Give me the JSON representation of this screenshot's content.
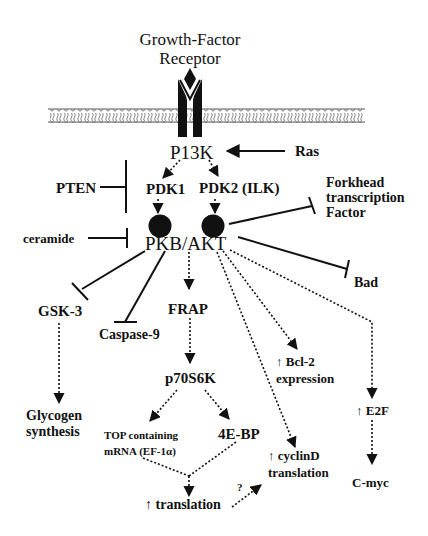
{
  "diagram": {
    "type": "signaling-pathway",
    "receptor": {
      "title_line1": "Growth-Factor",
      "title_line2": "Receptor"
    },
    "nodes": {
      "pi3k": "P13K",
      "ras": "Ras",
      "pten": "PTEN",
      "pdk1": "PDK1",
      "pdk2": "PDK2 (ILK)",
      "forkhead_line1": "Forkhead",
      "forkhead_line2": "transcription",
      "forkhead_line3": "Factor",
      "ceramide": "ceramide",
      "pkb_akt": "PKB/AKT",
      "bad": "Bad",
      "gsk3": "GSK-3",
      "caspase9": "Caspase-9",
      "frap": "FRAP",
      "bcl2_line1": "↑ Bcl-2",
      "bcl2_line2": "expression",
      "p70s6k": "p70S6K",
      "e2f": "↑ E2F",
      "glycogen_line1": "Glycogen",
      "glycogen_line2": "synthesis",
      "top_line1": "TOP containing",
      "top_line2": "mRNA (EF-1α)",
      "fourebp": "4E-BP",
      "cyclind_line1": "↑ cyclinD",
      "cyclind_line2": "translation",
      "cmyc": "C-myc",
      "translation": "↑ translation",
      "question": "?"
    },
    "edges": [
      {
        "from": "Ras",
        "to": "P13K",
        "type": "activation-solid"
      },
      {
        "from": "P13K",
        "to": "PDK1",
        "type": "activation-dotted"
      },
      {
        "from": "P13K",
        "to": "PDK2 (ILK)",
        "type": "activation-dotted"
      },
      {
        "from": "PTEN",
        "to": "P13K/PDK",
        "type": "inhibition"
      },
      {
        "from": "PDK1",
        "to": "PKB/AKT",
        "type": "activation-dotted"
      },
      {
        "from": "PDK2 (ILK)",
        "to": "PKB/AKT",
        "type": "activation-dotted"
      },
      {
        "from": "ceramide",
        "to": "PKB/AKT",
        "type": "inhibition"
      },
      {
        "from": "PKB/AKT",
        "to": "Forkhead transcription Factor",
        "type": "inhibition"
      },
      {
        "from": "PKB/AKT",
        "to": "Bad",
        "type": "inhibition"
      },
      {
        "from": "PKB/AKT",
        "to": "GSK-3",
        "type": "inhibition"
      },
      {
        "from": "PKB/AKT",
        "to": "Caspase-9",
        "type": "inhibition"
      },
      {
        "from": "PKB/AKT",
        "to": "FRAP",
        "type": "activation-dotted"
      },
      {
        "from": "PKB/AKT",
        "to": "Bcl-2 expression",
        "type": "activation-dotted"
      },
      {
        "from": "PKB/AKT",
        "to": "cyclinD translation",
        "type": "activation-dotted"
      },
      {
        "from": "PKB/AKT",
        "to": "E2F",
        "type": "activation-dotted"
      },
      {
        "from": "GSK-3",
        "to": "Glycogen synthesis",
        "type": "activation-dotted"
      },
      {
        "from": "FRAP",
        "to": "p70S6K",
        "type": "activation-dotted"
      },
      {
        "from": "p70S6K",
        "to": "TOP containing mRNA (EF-1α)",
        "type": "activation-dotted"
      },
      {
        "from": "p70S6K",
        "to": "4E-BP",
        "type": "activation-dotted"
      },
      {
        "from": "TOP containing mRNA (EF-1α)",
        "to": "translation",
        "type": "activation-dotted"
      },
      {
        "from": "4E-BP",
        "to": "translation",
        "type": "activation-dotted"
      },
      {
        "from": "translation",
        "to": "cyclinD translation",
        "type": "activation-dotted",
        "label": "?"
      },
      {
        "from": "E2F",
        "to": "C-myc",
        "type": "activation-dotted"
      }
    ],
    "colors": {
      "ink": "#111111",
      "background": "#ffffff",
      "membrane": "#555555"
    }
  }
}
